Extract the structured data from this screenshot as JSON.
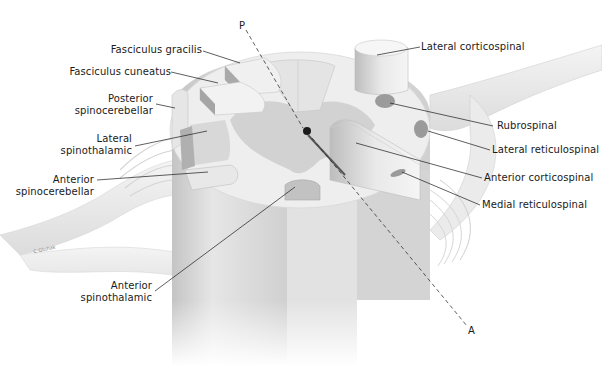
{
  "figure": {
    "type": "anatomical-diagram",
    "colors": {
      "background": "#ffffff",
      "cord_light": "#ececec",
      "cord_mid": "#d6d6d6",
      "gray_matter": "#cfcfcf",
      "tract_dark": "#9a9a9a",
      "leader_line": "#1a1a1a",
      "text": "#1a1a1a"
    }
  },
  "axis": {
    "posterior_label": "P",
    "anterior_label": "A"
  },
  "labels": {
    "left": [
      {
        "id": "fasciculus-gracilis",
        "lines": [
          "Fasciculus gracilis"
        ]
      },
      {
        "id": "fasciculus-cuneatus",
        "lines": [
          "Fasciculus cuneatus"
        ]
      },
      {
        "id": "posterior-spinocerebellar",
        "lines": [
          "Posterior",
          "spinocerebellar"
        ]
      },
      {
        "id": "lateral-spinothalamic",
        "lines": [
          "Lateral",
          "spinothalamic"
        ]
      },
      {
        "id": "anterior-spinocerebellar",
        "lines": [
          "Anterior",
          "spinocerebellar"
        ]
      },
      {
        "id": "anterior-spinothalamic",
        "lines": [
          "Anterior",
          "spinothalamic"
        ]
      }
    ],
    "right": [
      {
        "id": "lateral-corticospinal",
        "lines": [
          "Lateral corticospinal"
        ]
      },
      {
        "id": "rubrospinal",
        "lines": [
          "Rubrospinal"
        ]
      },
      {
        "id": "lateral-reticulospinal",
        "lines": [
          "Lateral reticulospinal"
        ]
      },
      {
        "id": "anterior-corticospinal",
        "lines": [
          "Anterior corticospinal"
        ]
      },
      {
        "id": "medial-reticulospinal",
        "lines": [
          "Medial reticulospinal"
        ]
      }
    ]
  },
  "signature": "C.Gluhak"
}
